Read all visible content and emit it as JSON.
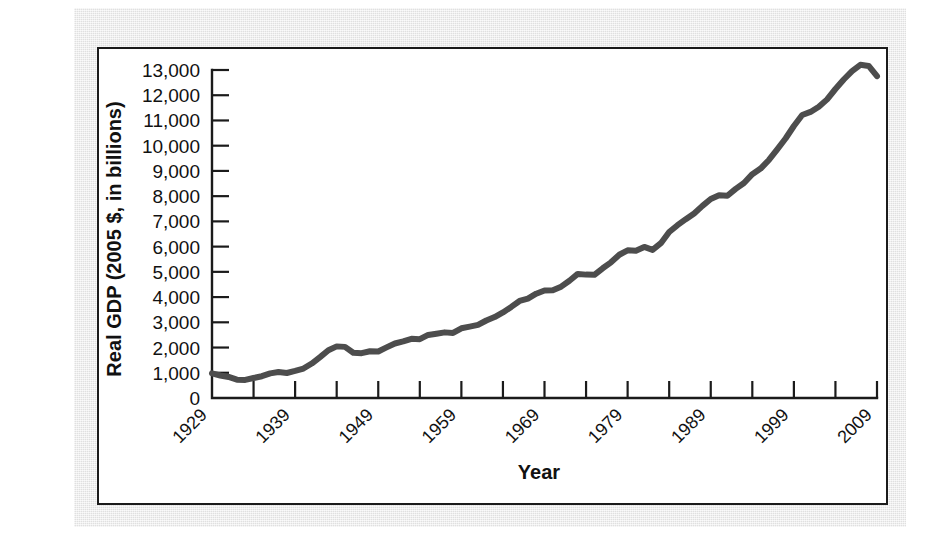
{
  "figure": {
    "panel_background": "#ffffff",
    "page_background": "#e9e9e9",
    "border_color": "#1b1b1b"
  },
  "chart_data": {
    "type": "line",
    "title": "",
    "subtitle": "",
    "xlabel": "Year",
    "ylabel": "Real GDP (2005 $, in billions)",
    "xlim": [
      1929,
      2009
    ],
    "ylim": [
      0,
      13500
    ],
    "grid": false,
    "legend": null,
    "line_color": "#4d4d4d",
    "y_tick_labels": [
      "13,000",
      "12,000",
      "11,000",
      "10,000",
      "9,000",
      "8,000",
      "7,000",
      "6,000",
      "5,000",
      "4,000",
      "3,000",
      "2,000",
      "1,000",
      "0"
    ],
    "y_tick_values": [
      13000,
      12000,
      11000,
      10000,
      9000,
      8000,
      7000,
      6000,
      5000,
      4000,
      3000,
      2000,
      1000,
      0
    ],
    "x_tick_labels": [
      "1929",
      "1939",
      "1949",
      "1959",
      "1969",
      "1979",
      "1989",
      "1999",
      "2009"
    ],
    "x_tick_values": [
      1929,
      1939,
      1949,
      1959,
      1969,
      1979,
      1989,
      1999,
      2009
    ],
    "x_minor_tick_values": [
      1934,
      1944,
      1954,
      1964,
      1974,
      1984,
      1994,
      2004
    ],
    "series": [
      {
        "name": "Real GDP (2005 $, in billions)",
        "x": [
          1929,
          1930,
          1931,
          1932,
          1933,
          1934,
          1935,
          1936,
          1937,
          1938,
          1939,
          1940,
          1941,
          1942,
          1943,
          1944,
          1945,
          1946,
          1947,
          1948,
          1949,
          1950,
          1951,
          1952,
          1953,
          1954,
          1955,
          1956,
          1957,
          1958,
          1959,
          1960,
          1961,
          1962,
          1963,
          1964,
          1965,
          1966,
          1967,
          1968,
          1969,
          1970,
          1971,
          1972,
          1973,
          1974,
          1975,
          1976,
          1977,
          1978,
          1979,
          1980,
          1981,
          1982,
          1983,
          1984,
          1985,
          1986,
          1987,
          1988,
          1989,
          1990,
          1991,
          1992,
          1993,
          1994,
          1995,
          1996,
          1997,
          1998,
          1999,
          2000,
          2001,
          2002,
          2003,
          2004,
          2005,
          2006,
          2007,
          2008,
          2009
        ],
        "y": [
          977,
          892,
          834,
          725,
          716,
          794,
          864,
          977,
          1028,
          992,
          1073,
          1167,
          1367,
          1622,
          1895,
          2046,
          2026,
          1793,
          1776,
          1854,
          1844,
          2006,
          2161,
          2244,
          2347,
          2332,
          2500,
          2549,
          2601,
          2577,
          2763,
          2830,
          2897,
          3072,
          3207,
          3392,
          3610,
          3845,
          3942,
          4133,
          4262,
          4270,
          4412,
          4647,
          4917,
          4890,
          4880,
          5141,
          5377,
          5678,
          5855,
          5839,
          5987,
          5871,
          6136,
          6577,
          6849,
          7087,
          7313,
          7614,
          7886,
          8034,
          8015,
          8287,
          8523,
          8871,
          9094,
          9434,
          9854,
          10284,
          10780,
          11216,
          11338,
          11543,
          11836,
          12247,
          12623,
          12958,
          13206,
          13162,
          12758
        ]
      }
    ]
  },
  "axis_titles": {
    "x": "Year",
    "y": "Real GDP (2005 $, in billions)"
  }
}
